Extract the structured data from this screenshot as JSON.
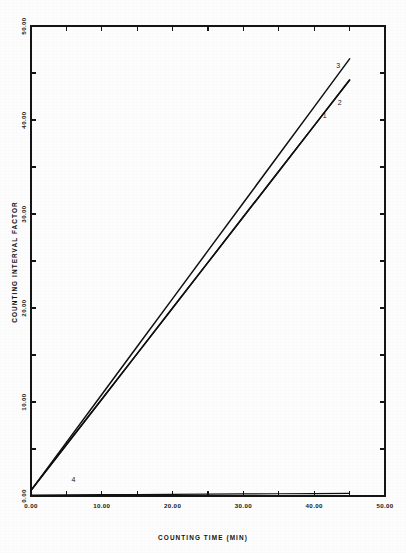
{
  "chart_data": {
    "type": "line",
    "title": "",
    "subtitle": "",
    "xlabel": "COUNTING TIME (MIN)",
    "ylabel": "COUNTING INTERVAL FACTOR",
    "xlim": [
      0,
      50
    ],
    "ylim": [
      0,
      50
    ],
    "grid": false,
    "legend_position": "inline-end-labels",
    "x_tick_labels": [
      "0.00",
      "10.00",
      "20.00",
      "30.00",
      "40.00",
      "50.00"
    ],
    "x_tick_values": [
      0,
      10,
      20,
      30,
      40,
      50
    ],
    "x_minor_tick_values": [
      5,
      15,
      25,
      35,
      45
    ],
    "y_tick_labels": [
      "0.00",
      "10.00",
      "20.00",
      "30.00",
      "40.00",
      "50.00"
    ],
    "y_tick_values": [
      0,
      10,
      20,
      30,
      40,
      50
    ],
    "y_minor_tick_values": [
      5,
      15,
      25,
      35,
      45
    ],
    "series": [
      {
        "name": "1",
        "label": "1",
        "label_x": 41.5,
        "label_y": 40.2,
        "x": [
          0,
          5,
          10,
          15,
          20,
          25,
          30,
          35,
          40,
          45
        ],
        "values": [
          0.6,
          5.45,
          10.3,
          15.15,
          20.0,
          24.85,
          29.7,
          34.55,
          39.4,
          44.25
        ]
      },
      {
        "name": "2",
        "label": "2",
        "label_x": 43.6,
        "label_y": 41.6,
        "x": [
          0,
          5,
          10,
          15,
          20,
          25,
          30,
          35,
          40,
          45
        ],
        "values": [
          0.6,
          5.45,
          10.3,
          15.15,
          20.0,
          24.85,
          29.7,
          34.55,
          39.4,
          44.25
        ]
      },
      {
        "name": "3",
        "label": "3",
        "label_x": 43.4,
        "label_y": 45.5,
        "x": [
          0,
          5,
          10,
          15,
          20,
          25,
          30,
          35,
          40,
          45
        ],
        "values": [
          0.6,
          5.7,
          10.8,
          15.9,
          21.0,
          26.1,
          31.2,
          36.3,
          41.4,
          46.5
        ]
      },
      {
        "name": "4",
        "label": "4",
        "label_x": 6.0,
        "label_y": 1.45,
        "x": [
          0,
          5,
          10,
          15,
          20,
          25,
          30,
          35,
          40,
          45
        ],
        "values": [
          0.1,
          0.12,
          0.14,
          0.16,
          0.18,
          0.2,
          0.22,
          0.24,
          0.26,
          0.28
        ]
      }
    ]
  },
  "figure": {
    "background_color": "#fdfdfd",
    "ink_color": "#111111"
  }
}
